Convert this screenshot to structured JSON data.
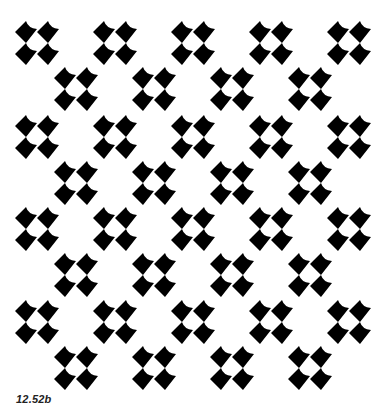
{
  "figure": {
    "caption": "12.52b",
    "background": "#ffffff",
    "ink": "#000000"
  },
  "pattern": {
    "motif": "four-scooped-diamond-cluster",
    "motif_size": 44,
    "rows": [
      {
        "y": 43,
        "xs": [
          37,
          115,
          193,
          271,
          349
        ]
      },
      {
        "y": 89,
        "xs": [
          76,
          154,
          232,
          310
        ]
      },
      {
        "y": 137,
        "xs": [
          37,
          115,
          193,
          271,
          349
        ]
      },
      {
        "y": 183,
        "xs": [
          76,
          154,
          232,
          310
        ]
      },
      {
        "y": 229,
        "xs": [
          37,
          115,
          193,
          271,
          349
        ]
      },
      {
        "y": 275,
        "xs": [
          76,
          154,
          232,
          310
        ]
      },
      {
        "y": 322,
        "xs": [
          37,
          115,
          193,
          271,
          349
        ]
      },
      {
        "y": 368,
        "xs": [
          76,
          154,
          232,
          310
        ]
      }
    ]
  }
}
